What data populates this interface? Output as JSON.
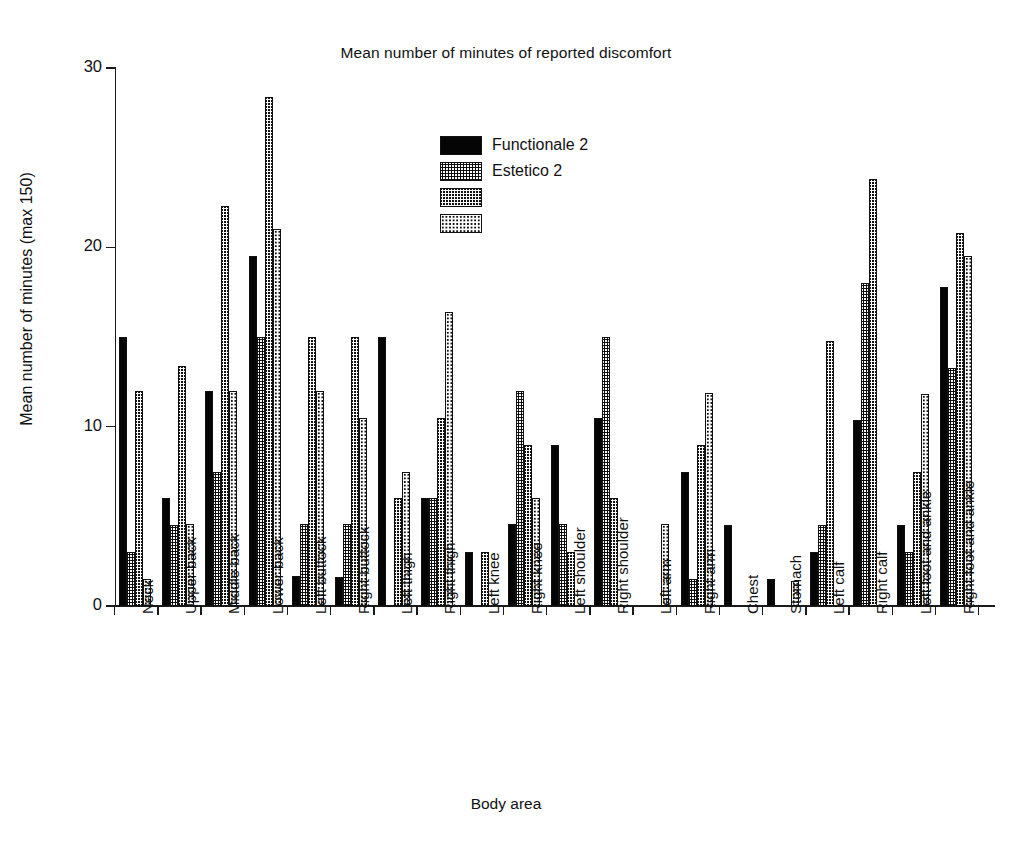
{
  "chart_data": {
    "type": "bar",
    "title": "Mean number of minutes of reported discomfort",
    "xlabel": "Body area",
    "ylabel": "Mean number of minutes (max 150)",
    "ylim": [
      0,
      30
    ],
    "yticks": [
      0,
      10,
      20,
      30
    ],
    "ytick_labels": [
      "0",
      "10",
      "20",
      "30"
    ],
    "grid": false,
    "legend_position": "upper-center",
    "legend": [
      "Functionale 2",
      "Estetico 2",
      "",
      ""
    ],
    "categories": [
      "Neck",
      "Upper back",
      "Middle back",
      "Lower back",
      "Left buttock",
      "Right buttock",
      "Left thigh",
      "Right thigh",
      "Left knee",
      "Right knee",
      "Left shoulder",
      "Right shoulder",
      "Left arm",
      "Right arm",
      "Chest",
      "Stomach",
      "Left calf",
      "Right calf",
      "Left foot and ankle",
      "Right foot and ankle"
    ],
    "series": [
      {
        "name": "Functionale 2",
        "pattern": "solid-black",
        "values": [
          15,
          6,
          12,
          19.5,
          1.7,
          1.6,
          15,
          6,
          3,
          4.6,
          9,
          10.5,
          null,
          7.5,
          4.5,
          1.5,
          3,
          10.4,
          4.5,
          17.8
        ]
      },
      {
        "name": "Estetico 2",
        "pattern": "coarse-dots-light",
        "values": [
          3,
          4.5,
          7.5,
          15,
          4.6,
          4.6,
          null,
          6,
          null,
          12,
          4.6,
          15,
          null,
          1.5,
          null,
          null,
          4.5,
          18,
          3,
          13.3
        ]
      },
      {
        "name": "",
        "pattern": "dense-dots-dark",
        "values": [
          12,
          13.4,
          22.3,
          28.4,
          15,
          15,
          6,
          10.5,
          3,
          9,
          3,
          6,
          null,
          9,
          null,
          null,
          14.8,
          23.8,
          7.5,
          20.8
        ]
      },
      {
        "name": "",
        "pattern": "fine-dots-light",
        "values": [
          1.5,
          4.6,
          12,
          21,
          12,
          10.5,
          7.5,
          16.4,
          null,
          6,
          null,
          null,
          4.6,
          11.9,
          null,
          1.4,
          null,
          null,
          11.8,
          19.5
        ]
      }
    ]
  }
}
